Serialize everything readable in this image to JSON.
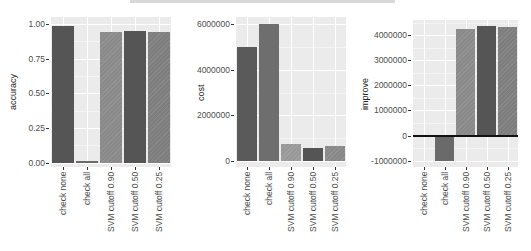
{
  "chart_data": [
    {
      "type": "bar",
      "title": "",
      "xlabel": "",
      "ylabel": "accuracy",
      "categories": [
        "check none",
        "check all",
        "SVM cutoff 0.90",
        "SVM cutoff 0.50",
        "SVM cutoff 0.25"
      ],
      "values": [
        0.985,
        0.015,
        0.94,
        0.95,
        0.94
      ],
      "yticks": [
        "0.00",
        "0.25",
        "0.50",
        "0.75",
        "1.00"
      ],
      "ylim": [
        -0.03,
        1.05
      ],
      "grid": true,
      "colors": [
        "#555555",
        "#6a6a6a",
        "#8a8a8a",
        "#555555",
        "#7e7e7e"
      ]
    },
    {
      "type": "bar",
      "title": "",
      "xlabel": "",
      "ylabel": "cost",
      "categories": [
        "check none",
        "check all",
        "SVM cutoff 0.90",
        "SVM cutoff 0.50",
        "SVM cutoff 0.25"
      ],
      "values": [
        5000000,
        6000000,
        750000,
        600000,
        650000
      ],
      "yticks": [
        "0",
        "2000000",
        "4000000",
        "6000000"
      ],
      "ylim": [
        -250000,
        6300000
      ],
      "grid": true,
      "colors": [
        "#5a5a5a",
        "#6e6e6e",
        "#999999",
        "#555555",
        "#888888"
      ]
    },
    {
      "type": "bar",
      "title": "",
      "xlabel": "",
      "ylabel": "improve",
      "categories": [
        "check none",
        "check all",
        "SVM cutoff 0.90",
        "SVM cutoff 0.50",
        "SVM cutoff 0.25"
      ],
      "values": [
        0,
        -1000000,
        4250000,
        4380000,
        4320000
      ],
      "yticks": [
        "-1000000",
        "0",
        "1000000",
        "2000000",
        "3000000",
        "4000000"
      ],
      "ylim": [
        -1250000,
        4600000
      ],
      "grid": true,
      "zero_line": true,
      "colors": [
        "#777777",
        "#6a6a6a",
        "#8a8a8a",
        "#555555",
        "#7e7e7e"
      ]
    }
  ]
}
